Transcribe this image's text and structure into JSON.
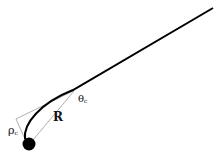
{
  "diagram": {
    "labels": {
      "theta": "θ",
      "theta_sub": "c",
      "R": "R",
      "rho": "ρ",
      "rho_sub": "c"
    },
    "colors": {
      "curve": "#000000",
      "construction_lines": "#9a9a9a",
      "ball": "#000000",
      "background": "#ffffff"
    },
    "elements": [
      "curved trajectory from ball to upper right",
      "black ball at lower left",
      "tangent triangle construction",
      "radius line R",
      "angle label theta_c",
      "distance label rho_c"
    ]
  }
}
